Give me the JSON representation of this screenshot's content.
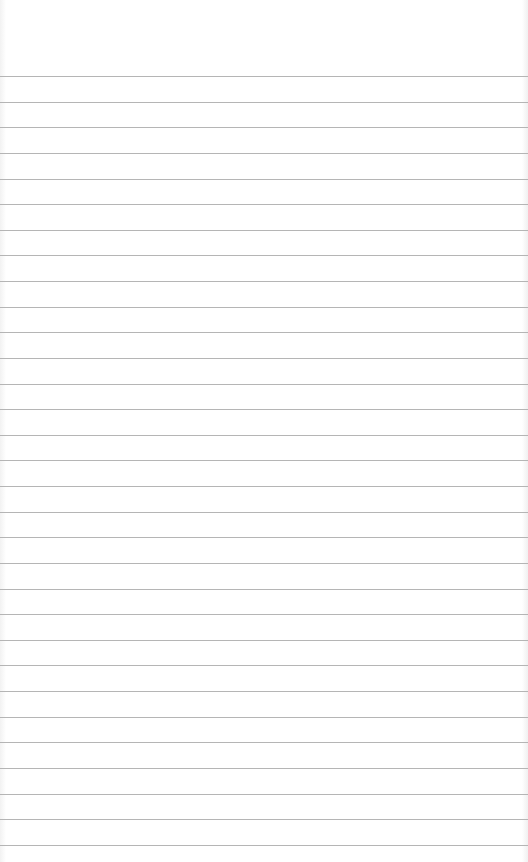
{
  "paper": {
    "background_color": "#ffffff",
    "line_color": "#b5b5b5",
    "first_line_y": 76,
    "line_spacing": 25.63,
    "line_count": 31
  }
}
